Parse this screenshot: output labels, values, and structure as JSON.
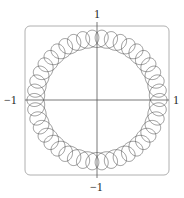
{
  "page": {
    "top_cut_text": ""
  },
  "chart_data": {
    "type": "line",
    "title": "",
    "subtitle": "",
    "xlabel": "",
    "ylabel": "",
    "xlim": [
      -1,
      1
    ],
    "ylim": [
      -1,
      1
    ],
    "grid": false,
    "legend": null,
    "tick_labels": {
      "top": "1",
      "bottom": "−1",
      "left": "−1",
      "right": "1"
    },
    "series": [
      {
        "name": "parametric curve",
        "kind": "parametric",
        "description": "ring of overlapping loops: x = r0 cos t + a cos(n t), y = r0 sin t - a sin(n t)",
        "r0": 0.875,
        "a": 0.125,
        "n": 41,
        "t_range": [
          0,
          6.2832
        ],
        "color": "#444444"
      }
    ],
    "frame": {
      "rounded": true,
      "color": "#aaaaaa"
    }
  }
}
